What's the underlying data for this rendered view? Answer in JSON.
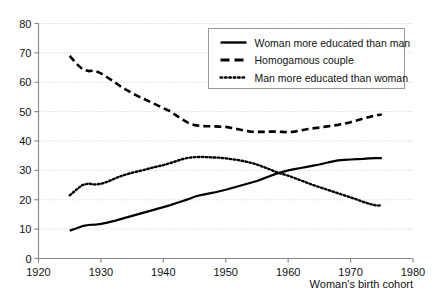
{
  "chart_data": {
    "type": "line",
    "title": "",
    "subtitle": "",
    "xlabel": "Woman's  birth cohort",
    "ylabel": "",
    "xlim": [
      1920,
      1980
    ],
    "ylim": [
      0,
      80
    ],
    "xticks": [
      1920,
      1930,
      1940,
      1950,
      1960,
      1970,
      1980
    ],
    "yticks": [
      0,
      10,
      20,
      30,
      40,
      50,
      60,
      70,
      80
    ],
    "xtick_labels": [
      "1920",
      "1930",
      "1940",
      "1950",
      "1960",
      "1970",
      "1980"
    ],
    "ytick_labels": [
      "0",
      "10",
      "20",
      "30",
      "40",
      "50",
      "60",
      "70",
      "80"
    ],
    "grid": "horizontal-dotted",
    "legend_position": "top-right",
    "x": [
      1925,
      1926,
      1927,
      1928,
      1929,
      1930,
      1931,
      1932,
      1933,
      1934,
      1935,
      1936,
      1937,
      1938,
      1939,
      1940,
      1941,
      1942,
      1943,
      1944,
      1945,
      1946,
      1947,
      1948,
      1949,
      1950,
      1951,
      1952,
      1953,
      1954,
      1955,
      1956,
      1957,
      1958,
      1959,
      1960,
      1961,
      1962,
      1963,
      1964,
      1965,
      1966,
      1967,
      1968,
      1969,
      1970,
      1971,
      1972,
      1973,
      1974,
      1975
    ],
    "series": [
      {
        "name": "Woman more educated than man",
        "style": "solid",
        "color": "#000000",
        "values": [
          9.5,
          10.2,
          11.0,
          11.4,
          11.5,
          11.8,
          12.2,
          12.7,
          13.3,
          13.9,
          14.5,
          15.1,
          15.7,
          16.3,
          16.9,
          17.5,
          18.1,
          18.8,
          19.5,
          20.2,
          21.0,
          21.6,
          22.0,
          22.4,
          22.9,
          23.4,
          24.0,
          24.6,
          25.2,
          25.8,
          26.4,
          27.2,
          28.0,
          28.8,
          29.4,
          30.0,
          30.4,
          30.8,
          31.2,
          31.6,
          32.0,
          32.5,
          33.0,
          33.4,
          33.6,
          33.7,
          33.8,
          33.9,
          34.1,
          34.2,
          34.2
        ]
      },
      {
        "name": "Homogamous couple",
        "style": "dashed",
        "color": "#000000",
        "values": [
          69.0,
          66.5,
          64.5,
          63.8,
          64.0,
          63.0,
          61.7,
          60.3,
          58.8,
          57.5,
          56.3,
          55.2,
          54.2,
          53.2,
          52.2,
          51.2,
          50.2,
          48.8,
          47.4,
          46.2,
          45.4,
          45.1,
          45.0,
          45.0,
          44.9,
          44.8,
          44.4,
          44.0,
          43.5,
          43.2,
          43.1,
          43.1,
          43.2,
          43.2,
          43.1,
          43.0,
          43.2,
          43.6,
          44.0,
          44.3,
          44.6,
          44.9,
          45.2,
          45.5,
          45.9,
          46.4,
          47.0,
          47.6,
          48.2,
          48.7,
          49.0
        ]
      },
      {
        "name": "Man more educated than woman",
        "style": "dotted",
        "color": "#000000",
        "values": [
          21.5,
          23.3,
          25.0,
          25.5,
          25.2,
          25.4,
          26.1,
          27.0,
          27.9,
          28.6,
          29.2,
          29.7,
          30.2,
          30.8,
          31.3,
          31.8,
          32.4,
          33.1,
          33.8,
          34.3,
          34.5,
          34.6,
          34.5,
          34.4,
          34.3,
          34.1,
          33.8,
          33.5,
          33.1,
          32.6,
          32.0,
          31.2,
          30.4,
          29.5,
          28.8,
          28.2,
          27.4,
          26.6,
          25.8,
          25.0,
          24.3,
          23.6,
          22.9,
          22.2,
          21.5,
          20.8,
          20.1,
          19.3,
          18.6,
          18.1,
          18.0
        ]
      }
    ]
  },
  "legend": {
    "items": [
      {
        "label": "Woman more educated than man",
        "style": "solid"
      },
      {
        "label": "Homogamous couple",
        "style": "dashed"
      },
      {
        "label": "Man more educated than woman",
        "style": "dotted"
      }
    ]
  },
  "colors": {
    "line": "#000000",
    "grid": "#c8c8c8",
    "axis": "#8a8a8a",
    "legend_border": "#9a9a9a",
    "background": "#ffffff"
  }
}
